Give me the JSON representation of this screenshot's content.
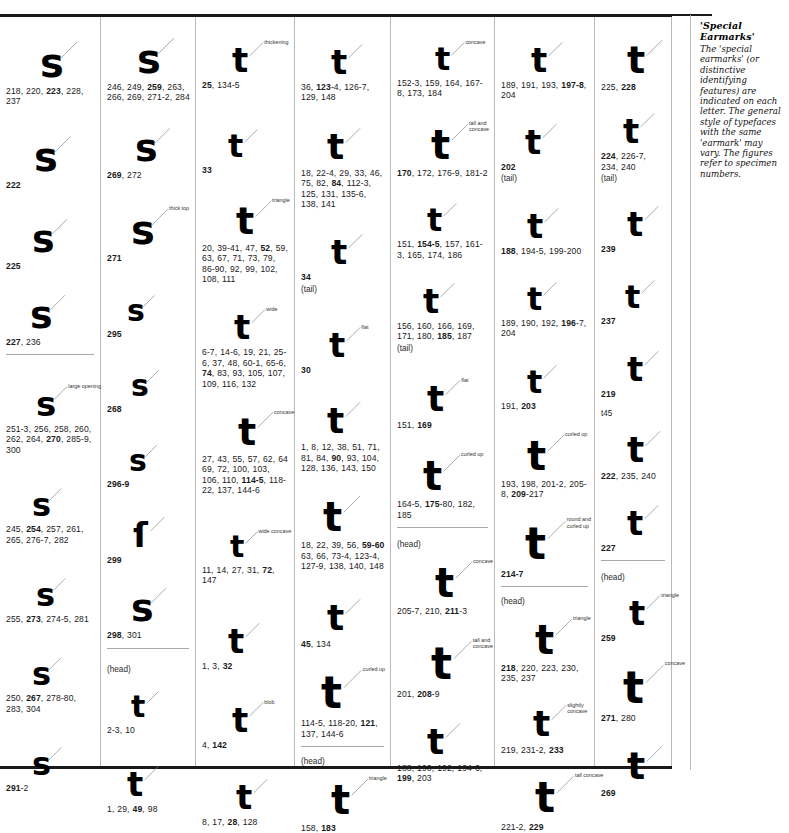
{
  "sidebar": {
    "title": "'Special Earmarks'",
    "body": "The 'special earmarks' (or distinctive identifying features) are indicated on each letter. The general style of typefaces with the same 'earmark' may vary. The figures refer to specimen numbers."
  },
  "columns": [
    {
      "id": "col-1",
      "letter": "s",
      "entries": [
        {
          "glyph": "s",
          "refs": "218, 220, 223, 228, 237",
          "bold": [
            "223"
          ],
          "earmark": "",
          "note": ""
        },
        {
          "glyph": "s",
          "refs": "222",
          "bold": [
            "222"
          ],
          "earmark": "",
          "note": ""
        },
        {
          "glyph": "s",
          "refs": "225",
          "bold": [
            "225"
          ],
          "earmark": "",
          "note": ""
        },
        {
          "glyph": "s",
          "refs": "227, 236",
          "bold": [
            "227"
          ],
          "earmark": "",
          "note": ""
        },
        {
          "glyph": "s",
          "refs": "251-3, 256, 258, 260, 262, 264, 270, 285-9, 300",
          "bold": [
            "270"
          ],
          "earmark": "large opening",
          "note": "",
          "divider_before": true
        },
        {
          "glyph": "s",
          "refs": "245, 254, 257, 261, 265, 276-7, 282",
          "bold": [
            "254"
          ],
          "earmark": "",
          "note": ""
        },
        {
          "glyph": "s",
          "refs": "255, 273, 274-5, 281",
          "bold": [
            "273"
          ],
          "earmark": "",
          "note": ""
        },
        {
          "glyph": "s",
          "refs": "250, 267, 278-80, 283, 304",
          "bold": [
            "267"
          ],
          "earmark": "",
          "note": ""
        },
        {
          "glyph": "s",
          "refs": "291-2",
          "bold": [
            "291"
          ],
          "earmark": "",
          "note": ""
        }
      ]
    },
    {
      "id": "col-2",
      "letter": "s",
      "entries": [
        {
          "glyph": "s",
          "refs": "246, 249, 259, 263, 266, 269, 271-2, 284",
          "bold": [
            "259"
          ],
          "earmark": "",
          "note": ""
        },
        {
          "glyph": "s",
          "refs": "269, 272",
          "bold": [
            "269"
          ],
          "earmark": "",
          "note": ""
        },
        {
          "glyph": "s",
          "refs": "271",
          "bold": [
            "271"
          ],
          "earmark": "thick top",
          "note": ""
        },
        {
          "glyph": "s",
          "refs": "295",
          "bold": [
            "295"
          ],
          "earmark": "",
          "note": ""
        },
        {
          "glyph": "s",
          "refs": "268",
          "bold": [
            "268"
          ],
          "earmark": "",
          "note": ""
        },
        {
          "glyph": "s",
          "refs": "296-9",
          "bold": [
            "296-9"
          ],
          "earmark": "",
          "note": ""
        },
        {
          "glyph": "ſ",
          "refs": "299",
          "bold": [
            "299"
          ],
          "earmark": "",
          "note": ""
        },
        {
          "glyph": "s",
          "refs": "298, 301",
          "bold": [
            "298"
          ],
          "earmark": "",
          "note": ""
        },
        {
          "glyph": "t",
          "refs": "2-3, 10",
          "bold": [
            "3"
          ],
          "earmark": "",
          "note": "(head)",
          "divider_before": true
        },
        {
          "glyph": "t",
          "refs": "1, 29, 49, 98",
          "bold": [
            "49"
          ],
          "earmark": "",
          "note": ""
        }
      ]
    },
    {
      "id": "col-3",
      "letter": "t",
      "entries": [
        {
          "glyph": "t",
          "refs": "25, 134-5",
          "bold": [
            "25"
          ],
          "earmark": "thickening",
          "note": ""
        },
        {
          "glyph": "t",
          "refs": "33",
          "bold": [
            "33"
          ],
          "earmark": "",
          "note": ""
        },
        {
          "glyph": "t",
          "refs": "20, 39-41, 47, 52, 59, 63, 67, 71, 73, 79, 86-90, 92, 99, 102, 108, 111",
          "bold": [
            "52"
          ],
          "earmark": "triangle",
          "note": ""
        },
        {
          "glyph": "t",
          "refs": "6-7, 14-6, 19, 21, 25-6, 37, 48, 60-1, 65-6, 74, 83, 93, 105, 107, 109, 116, 132",
          "bold": [
            "74"
          ],
          "earmark": "wide",
          "note": ""
        },
        {
          "glyph": "t",
          "refs": "27, 43, 55, 57, 62, 64 69, 72, 100, 103, 106, 110, 114-5, 118-22, 137, 144-6",
          "bold": [
            "114-5"
          ],
          "earmark": "concave",
          "note": ""
        },
        {
          "glyph": "t",
          "refs": "11, 14, 27, 31, 72, 147",
          "bold": [
            "72"
          ],
          "earmark": "wide concave",
          "note": ""
        },
        {
          "glyph": "t",
          "refs": "1, 3, 32",
          "bold": [
            "32"
          ],
          "earmark": "",
          "note": ""
        },
        {
          "glyph": "t",
          "refs": "4, 142",
          "bold": [
            "142"
          ],
          "earmark": "blob",
          "note": ""
        },
        {
          "glyph": "t",
          "refs": "8, 17, 28, 128",
          "bold": [
            "28"
          ],
          "earmark": "",
          "note": ""
        }
      ]
    },
    {
      "id": "col-4",
      "letter": "t",
      "entries": [
        {
          "glyph": "t",
          "refs": "36, 123-4, 126-7, 129, 148",
          "bold": [
            "123"
          ],
          "earmark": "",
          "note": ""
        },
        {
          "glyph": "t",
          "refs": "18, 22-4, 29, 33, 46, 75, 82, 84, 112-3, 125, 131, 135-6, 138, 141",
          "bold": [
            "84"
          ],
          "earmark": "",
          "note": ""
        },
        {
          "glyph": "t",
          "refs": "34",
          "bold": [
            "34"
          ],
          "earmark": "",
          "note": "(tail)"
        },
        {
          "glyph": "t",
          "refs": "30",
          "bold": [
            "30"
          ],
          "earmark": "flat",
          "note": ""
        },
        {
          "glyph": "t",
          "refs": "1, 8, 12, 38, 51, 71, 81, 84, 90, 93, 104, 128, 136, 143, 150",
          "bold": [
            "90"
          ],
          "earmark": "",
          "note": ""
        },
        {
          "glyph": "t",
          "refs": "18, 22, 39, 56, 59-60 63, 66, 73-4, 123-4, 127-9, 138, 140, 148",
          "bold": [
            "59-60"
          ],
          "earmark": "",
          "note": ""
        },
        {
          "glyph": "t",
          "refs": "45, 134",
          "bold": [
            "45"
          ],
          "earmark": "",
          "note": ""
        },
        {
          "glyph": "t",
          "refs": "114-5, 118-20, 121, 137, 144-6",
          "bold": [
            "121"
          ],
          "earmark": "curled up",
          "note": ""
        },
        {
          "glyph": "t",
          "refs": "158, 183",
          "bold": [
            "183"
          ],
          "earmark": "triangle",
          "note": "(head)",
          "divider_before": true
        }
      ]
    },
    {
      "id": "col-5",
      "letter": "t",
      "entries": [
        {
          "glyph": "t",
          "refs": "152-3, 159, 164, 167-8, 173, 184",
          "bold": [
            "3"
          ],
          "earmark": "concave",
          "note": ""
        },
        {
          "glyph": "t",
          "refs": "170, 172, 176-9, 181-2",
          "bold": [
            "170"
          ],
          "earmark": "tall and concave",
          "note": ""
        },
        {
          "glyph": "t",
          "refs": "151, 154-5, 157, 161-3, 165, 174, 186",
          "bold": [
            "154-5"
          ],
          "earmark": "",
          "note": ""
        },
        {
          "glyph": "t",
          "refs": "156, 160, 166, 169, 171, 180, 185, 187",
          "bold": [
            "185"
          ],
          "earmark": "",
          "note": "(tail)"
        },
        {
          "glyph": "t",
          "refs": "151, 169",
          "bold": [
            "169"
          ],
          "earmark": "flat",
          "note": ""
        },
        {
          "glyph": "t",
          "refs": "164-5, 175-80, 182, 185",
          "bold": [
            "175"
          ],
          "earmark": "curled up",
          "note": ""
        },
        {
          "glyph": "t",
          "refs": "205-7, 210, 211-3",
          "bold": [
            "211"
          ],
          "earmark": "concave",
          "note": "(head)",
          "divider_before": true
        },
        {
          "glyph": "t",
          "refs": "201, 208-9",
          "bold": [
            "208"
          ],
          "earmark": "tall and concave",
          "note": ""
        },
        {
          "glyph": "t",
          "refs": "188, 190, 192, 194-6, 199, 203",
          "bold": [
            "199"
          ],
          "earmark": "",
          "note": ""
        }
      ]
    },
    {
      "id": "col-6",
      "letter": "t",
      "entries": [
        {
          "glyph": "t",
          "refs": "189, 191, 193, 197-8, 204",
          "bold": [
            "197-8"
          ],
          "earmark": "",
          "note": ""
        },
        {
          "glyph": "t",
          "refs": "202",
          "bold": [
            "202"
          ],
          "earmark": "",
          "note": "(tail)"
        },
        {
          "glyph": "t",
          "refs": "188, 194-5, 199-200",
          "bold": [
            "188"
          ],
          "earmark": "",
          "note": ""
        },
        {
          "glyph": "t",
          "refs": "189, 190, 192, 196-7, 204",
          "bold": [
            "196"
          ],
          "earmark": "",
          "note": ""
        },
        {
          "glyph": "t",
          "refs": "191, 203",
          "bold": [
            "203"
          ],
          "earmark": "",
          "note": ""
        },
        {
          "glyph": "t",
          "refs": "193, 198, 201-2, 205-8, 209-217",
          "bold": [
            "209"
          ],
          "earmark": "curled up",
          "note": ""
        },
        {
          "glyph": "t",
          "refs": "214-7",
          "bold": [
            "214-7"
          ],
          "earmark": "round and curled up",
          "note": ""
        },
        {
          "glyph": "t",
          "refs": "218, 220, 223, 230, 235, 237",
          "bold": [
            "218"
          ],
          "earmark": "triangle",
          "note": "(head)",
          "divider_before": true
        },
        {
          "glyph": "t",
          "refs": "219, 231-2, 233",
          "bold": [
            "233"
          ],
          "earmark": "slightly concave",
          "note": ""
        },
        {
          "glyph": "t",
          "refs": "221-2, 229",
          "bold": [
            "229"
          ],
          "earmark": "tall concave",
          "note": ""
        }
      ]
    },
    {
      "id": "col-7",
      "letter": "t",
      "entries": [
        {
          "glyph": "t",
          "refs": "225, 228",
          "bold": [
            "228"
          ],
          "earmark": "",
          "note": ""
        },
        {
          "glyph": "t",
          "refs": "224, 226-7, 234, 240",
          "bold": [
            "224"
          ],
          "earmark": "",
          "note": "(tail)"
        },
        {
          "glyph": "t",
          "refs": "239",
          "bold": [
            "239"
          ],
          "earmark": "",
          "note": ""
        },
        {
          "glyph": "t",
          "refs": "237",
          "bold": [
            "237"
          ],
          "earmark": "",
          "note": ""
        },
        {
          "glyph": "t",
          "refs": "219",
          "bold": [
            "219"
          ],
          "earmark": "",
          "note": ""
        },
        {
          "glyph": "t",
          "refs": "222, 235, 240",
          "bold": [
            "222"
          ],
          "earmark": "",
          "note": "t45"
        },
        {
          "glyph": "t",
          "refs": "227",
          "bold": [
            "227"
          ],
          "earmark": "",
          "note": ""
        },
        {
          "glyph": "t",
          "refs": "259",
          "bold": [
            "259"
          ],
          "earmark": "triangle",
          "note": "(head)",
          "divider_before": true
        },
        {
          "glyph": "t",
          "refs": "271, 280",
          "bold": [
            "271"
          ],
          "earmark": "concave",
          "note": ""
        },
        {
          "glyph": "t",
          "refs": "269",
          "bold": [
            "269"
          ],
          "earmark": "",
          "note": ""
        }
      ]
    }
  ]
}
